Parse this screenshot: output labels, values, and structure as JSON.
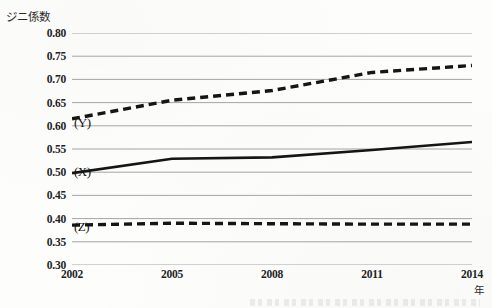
{
  "chart_data": {
    "type": "line",
    "title": "",
    "ylabel": "ジニ係数",
    "xlabel": "年",
    "ylim": [
      0.3,
      0.8
    ],
    "ytick_step": 0.05,
    "ytick_labels": [
      "0.80",
      "0.75",
      "0.70",
      "0.65",
      "0.60",
      "0.55",
      "0.50",
      "0.45",
      "0.40",
      "0.35",
      "0.30"
    ],
    "ytick_values": [
      0.8,
      0.75,
      0.7,
      0.65,
      0.6,
      0.55,
      0.5,
      0.45,
      0.4,
      0.35,
      0.3
    ],
    "categories": [
      "2002",
      "2005",
      "2008",
      "2011",
      "2014"
    ],
    "x": [
      2002,
      2005,
      2008,
      2011,
      2014
    ],
    "xlim": [
      2002,
      2014
    ],
    "grid": "horizontal",
    "legend_position": "inline-left",
    "series": [
      {
        "name": "(Y)",
        "style": "dashed",
        "values": [
          0.615,
          0.655,
          0.676,
          0.715,
          0.73
        ],
        "label_value": 0.607
      },
      {
        "name": "(X)",
        "style": "solid",
        "values": [
          0.498,
          0.529,
          0.532,
          0.548,
          0.565
        ],
        "label_value": 0.5
      },
      {
        "name": "(Z)",
        "style": "dashed",
        "values": [
          0.386,
          0.39,
          0.389,
          0.388,
          0.388
        ],
        "label_value": 0.381
      }
    ],
    "annotations": []
  }
}
